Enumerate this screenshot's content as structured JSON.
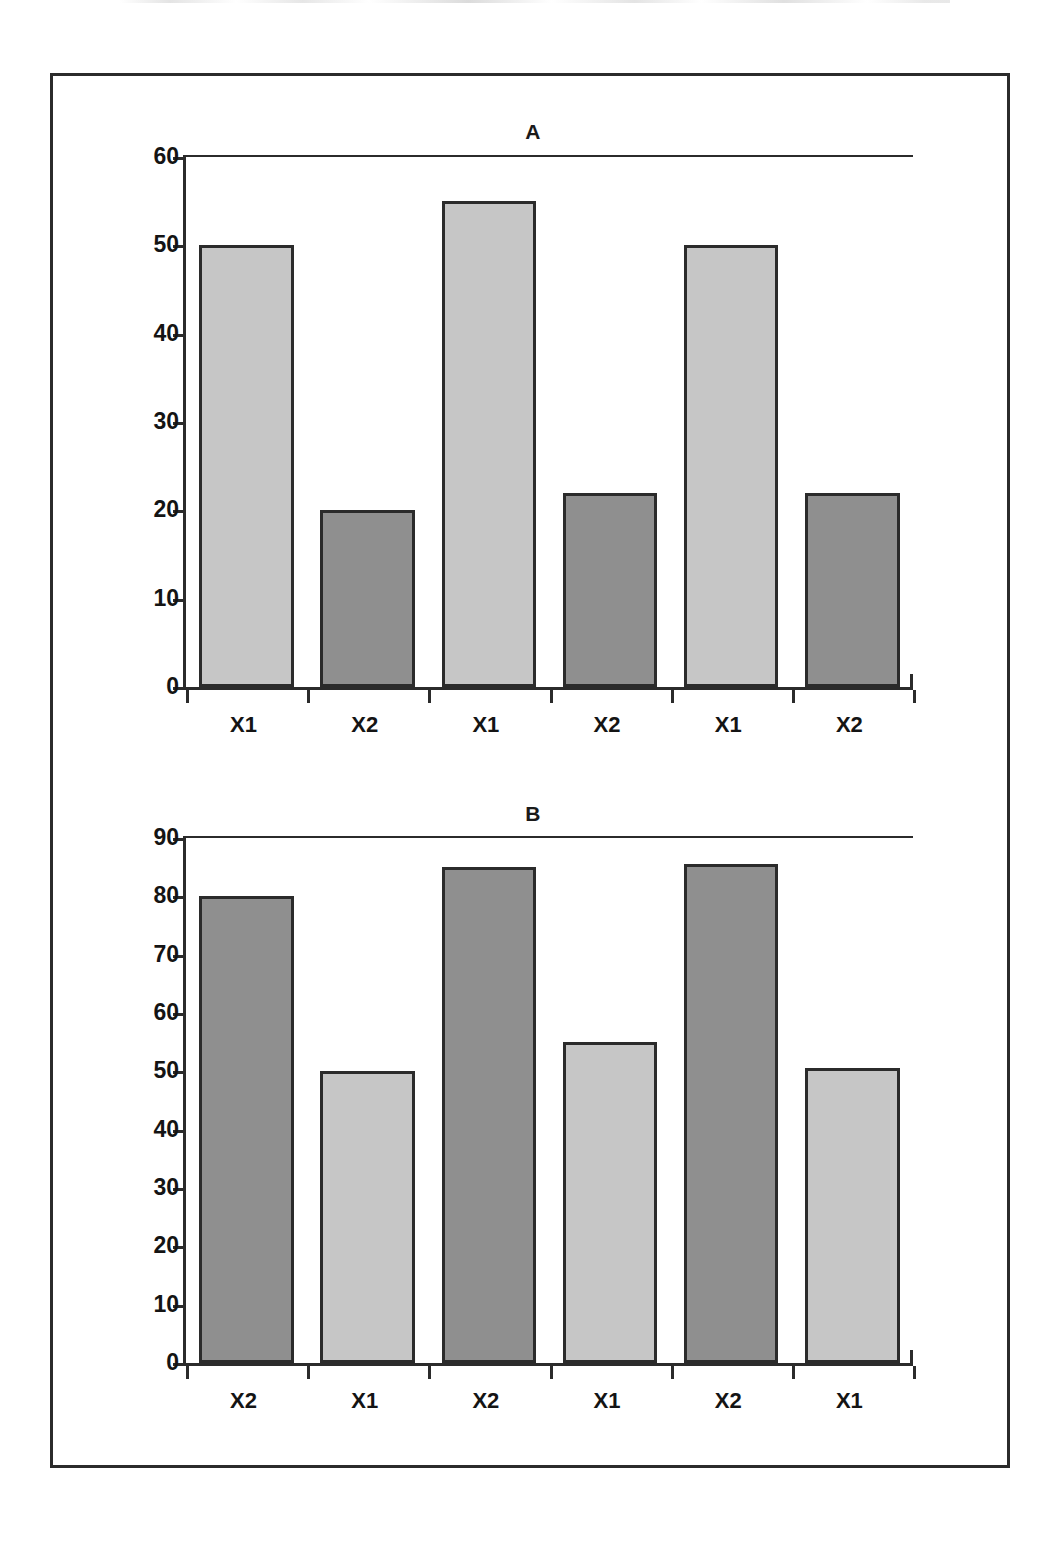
{
  "page": {
    "background_color": "#ffffff",
    "frame_color": "#2b2b2b"
  },
  "colors": {
    "light_bar": "#c6c6c6",
    "dark_bar": "#8f8f8f",
    "ink": "#1a1a1a"
  },
  "chart_data": [
    {
      "type": "bar",
      "title": "A",
      "xlabel": "",
      "ylabel": "",
      "ylim": [
        0,
        60
      ],
      "yticks": [
        0,
        10,
        20,
        30,
        40,
        50,
        60
      ],
      "categories": [
        "X1",
        "X2",
        "X1",
        "X2",
        "X1",
        "X2"
      ],
      "values": [
        50,
        20,
        55,
        22,
        50,
        22
      ],
      "bar_styles": [
        "light",
        "dark",
        "light",
        "dark",
        "light",
        "dark"
      ],
      "grid": false,
      "legend": "none"
    },
    {
      "type": "bar",
      "title": "B",
      "xlabel": "",
      "ylabel": "",
      "ylim": [
        0,
        90
      ],
      "yticks": [
        0,
        10,
        20,
        30,
        40,
        50,
        60,
        70,
        80,
        90
      ],
      "categories": [
        "X2",
        "X1",
        "X2",
        "X1",
        "X2",
        "X1"
      ],
      "values": [
        80,
        50,
        85,
        55,
        85.5,
        50.5
      ],
      "bar_styles": [
        "dark",
        "light",
        "dark",
        "light",
        "dark",
        "light"
      ],
      "grid": false,
      "legend": "none"
    }
  ]
}
